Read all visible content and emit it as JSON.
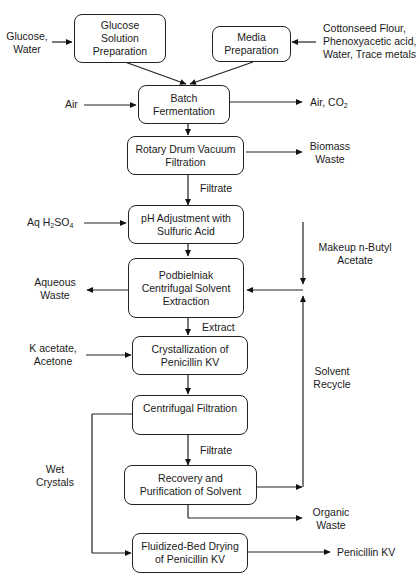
{
  "diagram": {
    "boxes": {
      "glucose_prep": "Glucose\nSolution\nPreparation",
      "media_prep": "Media\nPreparation",
      "batch_ferm": "Batch\nFermentation",
      "rotary": "Rotary Drum Vacuum\nFiltration",
      "ph_adj": "pH Adjustment with\nSulfuric Acid",
      "podbielniak": "Podbielniak\nCentrifugal Solvent\nExtraction",
      "crystallization": "Crystallization of\nPenicillin KV",
      "centrifugal": "Centrifugal Filtration",
      "recovery": "Recovery and\nPurification of Solvent",
      "drying": "Fluidized-Bed Drying\nof Penicillin KV"
    },
    "labels": {
      "glucose_water": "Glucose,\nWater",
      "media_inputs": "Cottonseed Flour,\nPhenoxyacetic acid,\nWater, Trace metals",
      "air_in": "Air",
      "air_co2_prefix": "Air, CO",
      "air_co2_sub": "2",
      "biomass": "Biomass\nWaste",
      "filtrate1": "Filtrate",
      "aq_prefix": "Aq H",
      "aq_sub1": "2",
      "aq_mid": "SO",
      "aq_sub2": "4",
      "makeup": "Makeup n-Butyl\nAcetate",
      "aqueous_waste": "Aqueous\nWaste",
      "extract": "Extract",
      "k_acetate": "K acetate,\nAcetone",
      "solvent_recycle": "Solvent\nRecycle",
      "wet_crystals": "Wet\nCrystals",
      "filtrate2": "Filtrate",
      "organic_waste": "Organic\nWaste",
      "product": "Penicillin KV"
    }
  }
}
